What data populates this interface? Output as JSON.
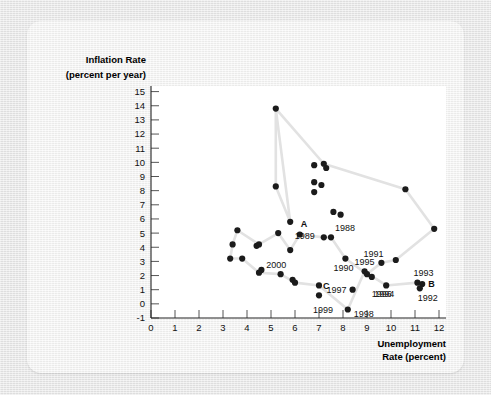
{
  "figure": {
    "background_color": "#e6e6e6",
    "card_color": "#f2f2f1",
    "plot_color": "#ffffff",
    "dot_color": "#1b1b1b",
    "line_color": "#e2e2e2"
  },
  "chart_data": {
    "type": "scatter",
    "title": "",
    "xlabel_line1": "Unemployment",
    "xlabel_line2": "Rate (percent)",
    "ylabel_line1": "Inflation Rate",
    "ylabel_line2": "(percent per year)",
    "xlim": [
      0,
      12.6
    ],
    "ylim": [
      -1,
      15.4
    ],
    "xticks": [
      0,
      1,
      2,
      3,
      4,
      5,
      6,
      7,
      8,
      9,
      10,
      11,
      12
    ],
    "yticks": [
      -1,
      0,
      1,
      2,
      3,
      4,
      5,
      6,
      7,
      8,
      9,
      10,
      11,
      12,
      13,
      14,
      15
    ],
    "grid": false,
    "legend": "none",
    "connected": true,
    "points": [
      {
        "x": 5.2,
        "y": 13.8,
        "label": "",
        "label_dx": 0,
        "label_dy": 0,
        "bold": false
      },
      {
        "x": 5.2,
        "y": 8.3,
        "label": "",
        "label_dx": 0,
        "label_dy": 0,
        "bold": false
      },
      {
        "x": 5.8,
        "y": 5.8,
        "label": "",
        "label_dx": 0,
        "label_dy": 0,
        "bold": false
      },
      {
        "x": 6.8,
        "y": 9.8,
        "label": "",
        "label_dx": 0,
        "label_dy": 0,
        "bold": false
      },
      {
        "x": 7.2,
        "y": 9.9,
        "label": "",
        "label_dx": 0,
        "label_dy": 0,
        "bold": false
      },
      {
        "x": 7.3,
        "y": 9.6,
        "label": "",
        "label_dx": 0,
        "label_dy": 0,
        "bold": false
      },
      {
        "x": 6.8,
        "y": 8.6,
        "label": "",
        "label_dx": 0,
        "label_dy": 0,
        "bold": false
      },
      {
        "x": 6.8,
        "y": 7.9,
        "label": "",
        "label_dx": 0,
        "label_dy": 0,
        "bold": false
      },
      {
        "x": 7.1,
        "y": 8.4,
        "label": "",
        "label_dx": 0,
        "label_dy": 0,
        "bold": false
      },
      {
        "x": 7.6,
        "y": 6.5,
        "label": "",
        "label_dx": 0,
        "label_dy": 0,
        "bold": false
      },
      {
        "x": 7.9,
        "y": 6.3,
        "label": "",
        "label_dx": 0,
        "label_dy": 0,
        "bold": false
      },
      {
        "x": 10.6,
        "y": 8.1,
        "label": "",
        "label_dx": 0,
        "label_dy": 0,
        "bold": false
      },
      {
        "x": 11.8,
        "y": 5.3,
        "label": "",
        "label_dx": 0,
        "label_dy": 0,
        "bold": false
      },
      {
        "x": 3.6,
        "y": 5.2,
        "label": "",
        "label_dx": 0,
        "label_dy": 0,
        "bold": false
      },
      {
        "x": 3.4,
        "y": 4.2,
        "label": "",
        "label_dx": 0,
        "label_dy": 0,
        "bold": false
      },
      {
        "x": 3.3,
        "y": 3.2,
        "label": "",
        "label_dx": 0,
        "label_dy": 0,
        "bold": false
      },
      {
        "x": 3.8,
        "y": 3.2,
        "label": "",
        "label_dx": 0,
        "label_dy": 0,
        "bold": false
      },
      {
        "x": 4.4,
        "y": 4.1,
        "label": "",
        "label_dx": 0,
        "label_dy": 0,
        "bold": false
      },
      {
        "x": 4.5,
        "y": 4.2,
        "label": "",
        "label_dx": 0,
        "label_dy": 0,
        "bold": false
      },
      {
        "x": 4.6,
        "y": 2.4,
        "label": "",
        "label_dx": 0,
        "label_dy": 0,
        "bold": false
      },
      {
        "x": 4.5,
        "y": 2.2,
        "label": "",
        "label_dx": 0,
        "label_dy": 0,
        "bold": false
      },
      {
        "x": 5.3,
        "y": 5.0,
        "label": "",
        "label_dx": 0,
        "label_dy": 0,
        "bold": false
      },
      {
        "x": 5.4,
        "y": 2.1,
        "label": "",
        "label_dx": 0,
        "label_dy": 0,
        "bold": false
      },
      {
        "x": 5.9,
        "y": 1.7,
        "label": "",
        "label_dx": 0,
        "label_dy": 0,
        "bold": false
      },
      {
        "x": 6.0,
        "y": 1.5,
        "label": "",
        "label_dx": 0,
        "label_dy": 0,
        "bold": false
      },
      {
        "x": 5.8,
        "y": 3.8,
        "label": "2000",
        "label_dx": -24,
        "label_dy": 18,
        "bold": false
      },
      {
        "x": 6.2,
        "y": 4.9,
        "label": "A",
        "label_dx": 1,
        "label_dy": -8,
        "bold": true
      },
      {
        "x": 7.2,
        "y": 4.7,
        "label": "1989",
        "label_dx": -29,
        "label_dy": 2,
        "bold": false
      },
      {
        "x": 7.5,
        "y": 4.7,
        "label": "1988",
        "label_dx": 4,
        "label_dy": -6,
        "bold": false
      },
      {
        "x": 7.0,
        "y": 1.3,
        "label": "C",
        "label_dx": 4,
        "label_dy": 4,
        "bold": true
      },
      {
        "x": 7.0,
        "y": 0.6,
        "label": "1999",
        "label_dx": -6,
        "label_dy": 18,
        "bold": false
      },
      {
        "x": 8.1,
        "y": 3.2,
        "label": "1990",
        "label_dx": -12,
        "label_dy": 12,
        "bold": false
      },
      {
        "x": 8.2,
        "y": -0.4,
        "label": "1998",
        "label_dx": 6,
        "label_dy": 7,
        "bold": false
      },
      {
        "x": 8.4,
        "y": 1.0,
        "label": "1997",
        "label_dx": -26,
        "label_dy": 3,
        "bold": false
      },
      {
        "x": 8.9,
        "y": 2.3,
        "label": "1995",
        "label_dx": -10,
        "label_dy": -6,
        "bold": false
      },
      {
        "x": 9.0,
        "y": 2.1,
        "label": "",
        "label_dx": 0,
        "label_dy": 0,
        "bold": false
      },
      {
        "x": 9.2,
        "y": 1.9,
        "label": "1996",
        "label_dx": 0,
        "label_dy": 20,
        "bold": false
      },
      {
        "x": 9.6,
        "y": 2.9,
        "label": "1991",
        "label_dx": -18,
        "label_dy": -6,
        "bold": false
      },
      {
        "x": 9.8,
        "y": 1.3,
        "label": "1994",
        "label_dx": -12,
        "label_dy": 12,
        "bold": false
      },
      {
        "x": 10.2,
        "y": 3.1,
        "label": "",
        "label_dx": 0,
        "label_dy": 0,
        "bold": false
      },
      {
        "x": 11.1,
        "y": 1.5,
        "label": "1993",
        "label_dx": -4,
        "label_dy": -7,
        "bold": false
      },
      {
        "x": 11.3,
        "y": 1.4,
        "label": "B",
        "label_dx": 6,
        "label_dy": 3,
        "bold": true
      },
      {
        "x": 11.2,
        "y": 1.1,
        "label": "1992",
        "label_dx": -2,
        "label_dy": 13,
        "bold": false
      }
    ],
    "path": [
      [
        5.2,
        13.8
      ],
      [
        5.2,
        8.3
      ],
      [
        5.8,
        5.8
      ],
      [
        5.2,
        13.8
      ],
      [
        7.2,
        9.9
      ],
      [
        10.6,
        8.1
      ],
      [
        11.8,
        5.3
      ],
      [
        10.2,
        3.1
      ],
      [
        9.6,
        2.9
      ],
      [
        9.0,
        2.1
      ],
      [
        8.1,
        3.2
      ],
      [
        7.5,
        4.7
      ],
      [
        7.2,
        4.7
      ],
      [
        6.2,
        4.9
      ],
      [
        5.8,
        3.8
      ],
      [
        5.3,
        5.0
      ],
      [
        4.5,
        4.2
      ],
      [
        3.6,
        5.2
      ],
      [
        3.4,
        4.2
      ],
      [
        3.3,
        3.2
      ],
      [
        3.8,
        3.2
      ],
      [
        4.5,
        2.2
      ],
      [
        5.4,
        2.1
      ],
      [
        6.0,
        1.5
      ],
      [
        7.0,
        1.3
      ],
      [
        8.2,
        -0.4
      ],
      [
        8.9,
        2.3
      ],
      [
        9.8,
        1.3
      ],
      [
        11.1,
        1.5
      ],
      [
        11.3,
        1.4
      ]
    ]
  }
}
